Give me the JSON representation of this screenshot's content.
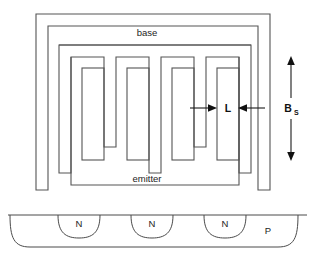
{
  "figure": {
    "plan_view": {
      "base_label": "base",
      "emitter_label": "emitter",
      "dimension_length_label": "L",
      "dimension_stripe_label": "B",
      "dimension_stripe_subscript": "S"
    },
    "cross_section": {
      "substrate_label": "P",
      "well_labels": [
        "N",
        "N",
        "N"
      ]
    },
    "colors": {
      "background": "#ffffff",
      "outline": "#545454",
      "dimension": "#111111",
      "text": "#1d1d1d"
    }
  }
}
